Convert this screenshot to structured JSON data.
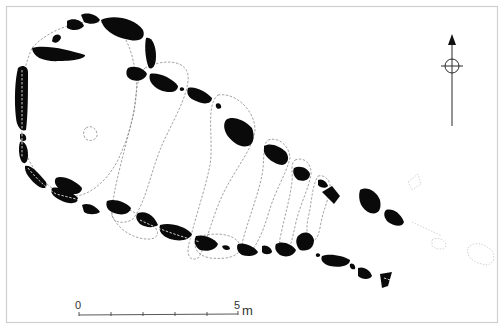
{
  "figure": {
    "type": "archaeological site plan",
    "colors": {
      "stones": "#0a0a0a",
      "outlines": "#7a7a7a",
      "frame": "#cfcfcf",
      "background": "#ffffff"
    }
  },
  "north_arrow": {
    "icon": "north-arrow-icon",
    "direction": "N"
  },
  "scale_bar": {
    "start_label": "0",
    "end_label": "5",
    "unit": "m",
    "divisions": 5
  }
}
